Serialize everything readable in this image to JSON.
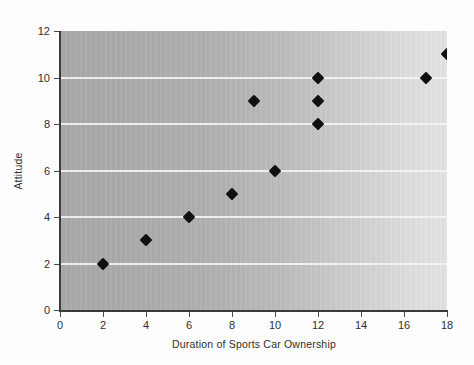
{
  "chart_data": {
    "type": "scatter",
    "title": "",
    "xlabel": "Duration of Sports Car Ownership",
    "ylabel": "Attitude",
    "xlim": [
      0,
      18
    ],
    "ylim": [
      0,
      12
    ],
    "xticks": [
      0,
      2,
      4,
      6,
      8,
      10,
      12,
      14,
      16,
      18
    ],
    "yticks": [
      0,
      2,
      4,
      6,
      8,
      10,
      12
    ],
    "grid": "horizontal",
    "gridlines_y": [
      2,
      4,
      6,
      8,
      10
    ],
    "legend": null,
    "marker_shape": "diamond",
    "marker_color": "#101010",
    "plot_background": {
      "gradient": "horizontal",
      "from": "#a9a9a9",
      "to": "#e3e3e3"
    },
    "points": [
      {
        "x": 2,
        "y": 2
      },
      {
        "x": 4,
        "y": 3
      },
      {
        "x": 6,
        "y": 4
      },
      {
        "x": 8,
        "y": 5
      },
      {
        "x": 9,
        "y": 9
      },
      {
        "x": 10,
        "y": 6
      },
      {
        "x": 12,
        "y": 8
      },
      {
        "x": 12,
        "y": 9
      },
      {
        "x": 12,
        "y": 10
      },
      {
        "x": 17,
        "y": 10
      },
      {
        "x": 18,
        "y": 11
      }
    ]
  }
}
